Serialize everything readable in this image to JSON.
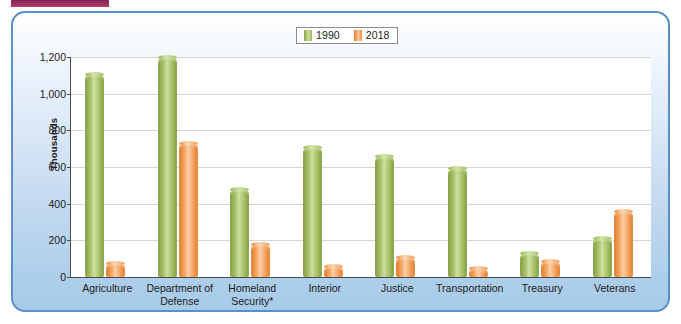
{
  "decoration": {
    "top_rule_color": "#9b2f5f",
    "panel_border_color": "#5b8fc9"
  },
  "legend": {
    "position": "top-center",
    "entries": [
      {
        "label": "1990",
        "color": "#9dba5c",
        "swatch": "green-swatch-icon"
      },
      {
        "label": "2018",
        "color": "#ee9049",
        "swatch": "orange-swatch-icon"
      }
    ]
  },
  "axis": {
    "y_title": "Thousands",
    "y_ticks": [
      "0",
      "200",
      "400",
      "600",
      "800",
      "1,000",
      "1,200"
    ]
  },
  "chart_data": {
    "type": "bar",
    "title": "",
    "subtitle": "",
    "xlabel": "",
    "ylabel": "Thousands",
    "ylim": [
      0,
      1200
    ],
    "ytick_values": [
      0,
      200,
      400,
      600,
      800,
      1000,
      1200
    ],
    "grid": true,
    "legend_position": "top-center",
    "categories": [
      "Agriculture",
      "Department of Defense",
      "Homeland Security*",
      "Interior",
      "Justice",
      "Transportation",
      "Treasury",
      "Veterans"
    ],
    "category_lines": [
      [
        "Agriculture"
      ],
      [
        "Department of",
        "Defense"
      ],
      [
        "Homeland",
        "Security*"
      ],
      [
        "Interior"
      ],
      [
        "Justice"
      ],
      [
        "Transportation"
      ],
      [
        "Treasury"
      ],
      [
        "Veterans"
      ]
    ],
    "series": [
      {
        "name": "1990",
        "color": "#9dba5c",
        "values": [
          1110,
          1200,
          478,
          708,
          660,
          592,
          130,
          215
        ]
      },
      {
        "name": "2018",
        "color": "#ee9049",
        "values": [
          78,
          730,
          182,
          60,
          108,
          48,
          88,
          362
        ]
      }
    ],
    "footnote": "*"
  }
}
